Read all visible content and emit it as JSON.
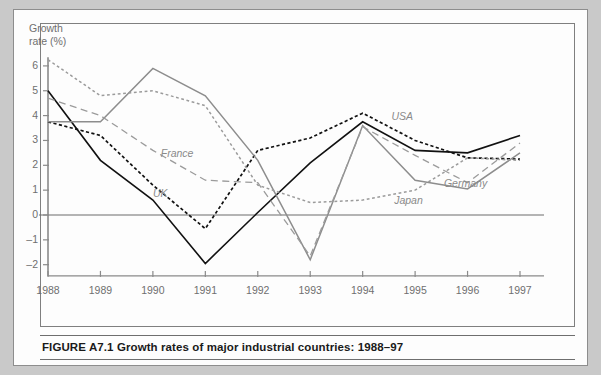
{
  "figure": {
    "caption": "FIGURE A7.1 Growth rates of major industrial countries: 1988–97",
    "axis_title_line1": "Growth",
    "axis_title_line2": "rate (%)"
  },
  "chart_data": {
    "type": "line",
    "title": "Growth rates of major industrial countries: 1988–97",
    "xlabel": "",
    "ylabel": "Growth rate (%)",
    "x": [
      1988,
      1989,
      1990,
      1991,
      1992,
      1993,
      1994,
      1995,
      1996,
      1997
    ],
    "categories": [
      "1988",
      "1989",
      "1990",
      "1991",
      "1992",
      "1993",
      "1994",
      "1995",
      "1996",
      "1997"
    ],
    "xlim": [
      1988,
      1997
    ],
    "ylim": [
      -2.6,
      6.4
    ],
    "yticks": [
      6,
      5,
      4,
      3,
      2,
      1,
      0,
      -1,
      -2
    ],
    "ytick_labels": [
      "6",
      "5",
      "4",
      "3",
      "2",
      "1",
      "0",
      "–1",
      "–2"
    ],
    "grid": false,
    "zero_line": true,
    "legend": "inline-labels",
    "series": [
      {
        "name": "UK",
        "style": "solid",
        "color": "#111111",
        "width": 1.6,
        "label_x": 1990.0,
        "label_y": 0.85,
        "values": [
          5.0,
          2.2,
          0.6,
          -1.95,
          0.1,
          2.1,
          3.75,
          2.6,
          2.5,
          3.2
        ]
      },
      {
        "name": "USA",
        "style": "dotted",
        "color": "#111111",
        "width": 1.7,
        "label_x": 1994.55,
        "label_y": 3.95,
        "values": [
          3.75,
          3.2,
          1.2,
          -0.55,
          2.6,
          3.1,
          4.1,
          3.0,
          2.3,
          2.25
        ]
      },
      {
        "name": "Germany",
        "style": "solid",
        "color": "#8d8d8d",
        "width": 1.5,
        "label_x": 1995.55,
        "label_y": 1.25,
        "values": [
          3.75,
          3.75,
          5.9,
          4.8,
          2.2,
          -1.8,
          3.6,
          1.4,
          1.05,
          2.5
        ]
      },
      {
        "name": "France",
        "style": "dashed",
        "color": "#9b9b9b",
        "width": 1.3,
        "label_x": 1990.15,
        "label_y": 2.45,
        "values": [
          4.7,
          4.0,
          2.6,
          1.4,
          1.3,
          -1.65,
          3.55,
          2.4,
          1.3,
          2.9
        ]
      },
      {
        "name": "Japan",
        "style": "dotted",
        "color": "#9b9b9b",
        "width": 1.5,
        "label_x": 1994.6,
        "label_y": 0.55,
        "values": [
          6.25,
          4.8,
          5.0,
          4.4,
          1.2,
          0.5,
          0.6,
          1.0,
          2.3,
          2.2
        ]
      }
    ]
  }
}
